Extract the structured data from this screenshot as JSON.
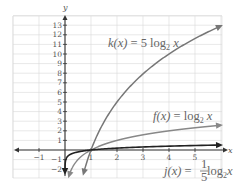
{
  "chart_data": {
    "type": "line",
    "title": "",
    "xlabel": "x",
    "ylabel": "y",
    "xlim": [
      -2,
      6
    ],
    "ylim": [
      -2.7,
      14
    ],
    "grid": true,
    "x_ticks": [
      -1,
      1,
      2,
      3,
      4,
      5
    ],
    "y_ticks": [
      -2,
      -1,
      1,
      2,
      3,
      4,
      5,
      6,
      7,
      8,
      9,
      10,
      11,
      12,
      13
    ],
    "series": [
      {
        "name": "k(x) = 5 log2 x",
        "formula": "5*log2(x)",
        "color": "#777777",
        "x": [
          0.75,
          1,
          1.5,
          2,
          3,
          4,
          5,
          6
        ],
        "values": [
          -2.08,
          0,
          2.92,
          5,
          7.92,
          10,
          11.61,
          12.92
        ]
      },
      {
        "name": "f(x) = log2 x",
        "formula": "log2(x)",
        "color": "#888888",
        "x": [
          0.2,
          0.5,
          1,
          2,
          3,
          4,
          5,
          6
        ],
        "values": [
          -2.32,
          -1,
          0,
          1,
          1.58,
          2,
          2.32,
          2.58
        ]
      },
      {
        "name": "j(x) = (1/5) log2 x",
        "formula": "0.2*log2(x)",
        "color": "#222222",
        "x": [
          0.001,
          0.05,
          0.25,
          0.5,
          1,
          2,
          4,
          6
        ],
        "values": [
          -1.99,
          -0.86,
          -0.4,
          -0.2,
          0,
          0.2,
          0.4,
          0.52
        ]
      }
    ],
    "annotations": [
      {
        "text": "k(x) = 5 log₂ x",
        "position": "upper middle"
      },
      {
        "text": "f(x) = log₂ x",
        "position": "right, above x-axis"
      },
      {
        "text": "j(x) = 1/5 log₂ x",
        "position": "bottom right"
      }
    ]
  },
  "labels": {
    "k": {
      "name": "k(x)",
      "eq": " = 5 log",
      "sub": "2",
      "var": " x"
    },
    "f": {
      "name": "f(x)",
      "eq": " = log",
      "sub": "2",
      "var": " x"
    },
    "j": {
      "name": "j(x)",
      "eq": " = ",
      "num": "1",
      "den": "5",
      "log": " log",
      "sub": "2",
      "var": "x"
    },
    "xaxis": "x",
    "yaxis": "y"
  }
}
